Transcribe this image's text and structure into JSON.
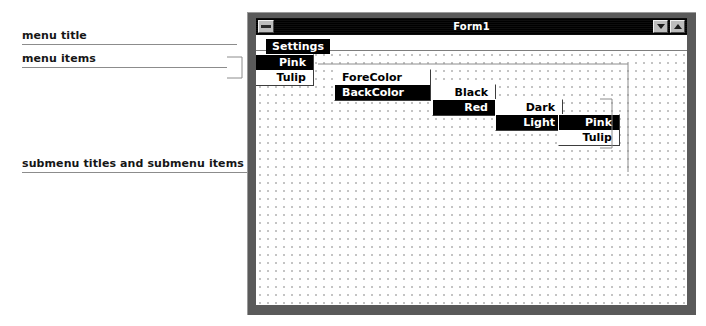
{
  "annotations": {
    "menu_title": "menu title",
    "menu_items": "menu items",
    "submenus": "submenu titles and submenu items"
  },
  "window": {
    "title": "Form1",
    "sysmenu_icon": "window-menu-icon",
    "minimize_icon": "minimize-icon",
    "maximize_icon": "maximize-icon"
  },
  "menus": {
    "menu_title": {
      "label": "Settings",
      "highlighted": true
    },
    "level1": [
      {
        "label": "Pink",
        "highlighted": true
      },
      {
        "label": "Tulip",
        "highlighted": false
      }
    ],
    "level2": [
      {
        "label": "ForeColor",
        "highlighted": false
      },
      {
        "label": "BackColor",
        "highlighted": true
      }
    ],
    "level3": [
      {
        "label": "Black",
        "highlighted": false
      },
      {
        "label": "Red",
        "highlighted": true
      }
    ],
    "level4": [
      {
        "label": "Dark",
        "highlighted": false
      },
      {
        "label": "Light",
        "highlighted": true
      }
    ],
    "level5": [
      {
        "label": "Pink",
        "highlighted": true
      },
      {
        "label": "Tulip",
        "highlighted": false
      }
    ]
  },
  "colors": {
    "title_bar": "#000000",
    "highlight_bg": "#000000",
    "highlight_fg": "#ffffff",
    "menu_bg": "#ffffff",
    "menu_fg": "#000000",
    "window_frame": "#5a5a5a",
    "grid_dot": "#c2c2c2",
    "leader_line": "#8c8c8c"
  }
}
